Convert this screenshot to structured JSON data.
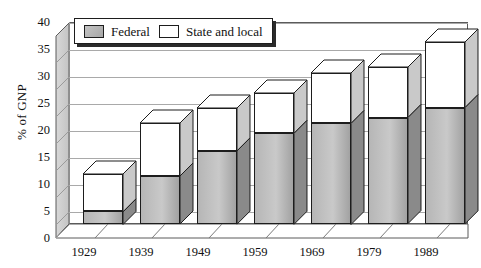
{
  "chart_data": {
    "type": "bar",
    "subtype": "stacked-column-3d",
    "title": "",
    "xlabel": "",
    "ylabel": "% of GNP",
    "ylim": [
      0,
      40
    ],
    "yticks": [
      0,
      5,
      10,
      15,
      20,
      25,
      30,
      35,
      40
    ],
    "ytick_labels": [
      "0",
      "5",
      "10",
      "15",
      "20",
      "25",
      "30",
      "35",
      "40"
    ],
    "grid": true,
    "grid_axis": "y",
    "legend_position": "top-left-inside",
    "categories": [
      "1929",
      "1939",
      "1949",
      "1959",
      "1969",
      "1979",
      "1989"
    ],
    "series": [
      {
        "name": "Federal",
        "color": "#b6b6b6",
        "values": [
          2.5,
          9.5,
          14.5,
          18.0,
          20.0,
          21.0,
          23.0
        ]
      },
      {
        "name": "State and local",
        "color": "#ffffff",
        "values": [
          7.5,
          10.5,
          8.5,
          8.0,
          10.0,
          10.0,
          13.0
        ]
      }
    ],
    "totals": [
      10.0,
      20.0,
      23.0,
      26.0,
      30.0,
      31.0,
      36.0
    ],
    "annotations": []
  },
  "legend": {
    "items": [
      {
        "label": "Federal",
        "swatch": "federal-swatch"
      },
      {
        "label": "State and local",
        "swatch": "state-local-swatch"
      }
    ]
  },
  "axes": {
    "y_title": "% of GNP",
    "y_tick_labels": [
      "40",
      "35",
      "30",
      "25",
      "20",
      "15",
      "10",
      "5",
      "0"
    ],
    "x_tick_labels": [
      "1929",
      "1939",
      "1949",
      "1959",
      "1969",
      "1979",
      "1989"
    ]
  },
  "colors": {
    "federal": "#b6b6b6",
    "state_local": "#ffffff",
    "outline": "#1d1d1d",
    "gridline": "#a9a9a9",
    "wall": "#c8c8c8",
    "background": "#ffffff"
  }
}
